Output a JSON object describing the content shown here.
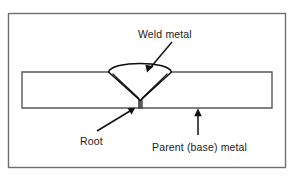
{
  "figure": {
    "name": "butt-weld-cross-section",
    "background_color": "#ffffff",
    "frame_color": "#6e6e70",
    "line_color": "#0c0c0c",
    "plate_color": "#58585a",
    "width": 294,
    "height": 177
  },
  "labels": {
    "weld_metal": "Weld metal",
    "root": "Root",
    "parent_metal": "Parent (base) metal"
  },
  "parts": {
    "plate_left": "parent-plate-left",
    "plate_right": "parent-plate-right",
    "weld_bead": "weld-bead-v-groove",
    "root_gap": "root-gap",
    "bevel_left": "bevel-face-left",
    "bevel_right": "bevel-face-right"
  },
  "geometry": {
    "frame": {
      "x": 8.5,
      "y": 13.5,
      "width": 277,
      "height": 154
    },
    "plate": {
      "left": 22,
      "right": 272,
      "top": 72,
      "bottom": 108
    },
    "groove": {
      "top_left_x": 110,
      "top_right_x": 170,
      "root_x": 140,
      "root_top_y": 100,
      "root_bottom_y": 108,
      "cap_peak_y": 60
    }
  },
  "leaders": {
    "weld_metal": {
      "from_x": 172,
      "from_y": 42,
      "to_x": 147,
      "to_y": 72
    },
    "root": {
      "from_x": 97,
      "from_y": 131,
      "to_x": 135,
      "to_y": 108
    },
    "parent_metal": {
      "from_x": 198,
      "from_y": 135,
      "to_x": 198,
      "to_y": 109
    }
  },
  "text_positions": {
    "weld_metal": {
      "x": 138,
      "y": 38
    },
    "root": {
      "x": 80,
      "y": 145
    },
    "parent_metal": {
      "x": 152,
      "y": 151
    }
  }
}
